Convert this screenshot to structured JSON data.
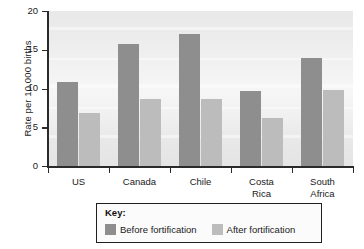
{
  "chart_data": {
    "type": "bar",
    "title": "",
    "xlabel": "",
    "ylabel": "Rate per 10,000 births",
    "ylim": [
      0,
      20
    ],
    "yticks": [
      0,
      5,
      10,
      15,
      20
    ],
    "ytick_labels": [
      "0",
      "5",
      "10",
      "15",
      "20"
    ],
    "grid": false,
    "legend_position": "bottom",
    "legend_title": "Key:",
    "categories": [
      "US",
      "Canada",
      "Chile",
      "Costa Rica",
      "South Africa"
    ],
    "series": [
      {
        "name": "Before fortification",
        "color": "#8e8e8e",
        "values": [
          10.8,
          15.8,
          17.0,
          9.7,
          14.0
        ]
      },
      {
        "name": "After fortification",
        "color": "#bcbcbc",
        "values": [
          6.9,
          8.6,
          8.6,
          6.2,
          9.8
        ]
      }
    ]
  },
  "axis": {
    "y_title": "Rate per 10,000 births"
  },
  "legend": {
    "title": "Key:",
    "items": [
      {
        "label": "Before fortification",
        "color": "#8e8e8e"
      },
      {
        "label": "After fortification",
        "color": "#bcbcbc"
      }
    ]
  },
  "category_labels": [
    "US",
    "Canada",
    "Chile",
    "Costa\nRica",
    "South\nAfrica"
  ],
  "colors": {
    "before": "#8e8e8e",
    "after": "#bcbcbc",
    "axis": "#2a2a2a",
    "plot_background": "#eeeeee",
    "page_background": "#ffffff"
  }
}
